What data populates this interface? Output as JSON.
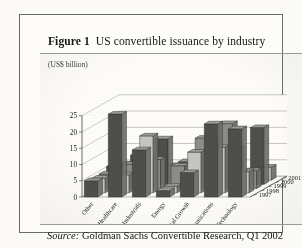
{
  "figure": {
    "number_label": "Figure 1",
    "caption": "US convertible issuance by industry"
  },
  "source": {
    "label": "Source:",
    "text": "Goldman Sachs Convertible Research, Q1 2002"
  },
  "chart_data": {
    "type": "bar",
    "variant": "3d-grouped",
    "title": "US convertible issuance by industry",
    "xlabel": "",
    "ylabel": "(US$ billion)",
    "zlabel": "",
    "ylim": [
      0,
      25
    ],
    "yticks": [
      0,
      5,
      10,
      15,
      20,
      25
    ],
    "ytick_labels": [
      "0",
      "5",
      "10",
      "15",
      "20",
      "25"
    ],
    "grid": true,
    "legend_position": "right-depth-axis",
    "categories": [
      "Other",
      "Healthcare",
      "Industrials",
      "Energy",
      "Con Cyclical Growth",
      "Communications",
      "Technology"
    ],
    "depth_labels": [
      "2001",
      "2000",
      "1999",
      "1998",
      "1997"
    ],
    "series": [
      {
        "name": "2001",
        "values": [
          5.0,
          25.5,
          14.5,
          2.0,
          7.5,
          22.5,
          21.0
        ]
      },
      {
        "name": "2000",
        "values": [
          4.5,
          5.5,
          17.5,
          2.0,
          12.5,
          14.0,
          6.5
        ]
      },
      {
        "name": "1999",
        "values": [
          4.5,
          7.5,
          9.0,
          7.0,
          15.5,
          20.0,
          5.5
        ]
      },
      {
        "name": "1998",
        "values": [
          5.5,
          9.0,
          14.0,
          7.0,
          11.0,
          11.0,
          17.5
        ]
      },
      {
        "name": "1997",
        "values": [
          5.0,
          6.5,
          4.5,
          2.5,
          6.0,
          2.5,
          4.0
        ]
      }
    ]
  },
  "colors": {
    "frame": "#6b6b66",
    "page": "#fbfaf7",
    "panel": "#fdfcf9",
    "text": "#171714",
    "axis": "#4a4a45",
    "bar_top": "#9a9a95",
    "bar_front_dark": "#4e4e4a",
    "bar_front_mid": "#8d8d88",
    "bar_front_light": "#c6c6c0",
    "bar_side": "#6e6e69"
  }
}
